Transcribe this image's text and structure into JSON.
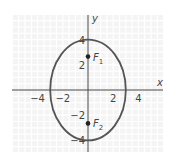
{
  "chart_data": {
    "type": "scatter",
    "title": "",
    "xlabel": "x",
    "ylabel": "y",
    "xlim": [
      -6,
      6
    ],
    "ylim": [
      -5,
      6
    ],
    "grid": true,
    "x_ticks": [
      -4,
      -2,
      2,
      4
    ],
    "y_ticks": [
      4,
      2,
      -2,
      -4
    ],
    "tick_labels": {
      "x": [
        "−4",
        "−2",
        "2",
        "4"
      ],
      "y": [
        "4",
        "2",
        "−2",
        "−4"
      ]
    },
    "ellipse": {
      "center": [
        0,
        0
      ],
      "semi_x": 3,
      "semi_y": 4
    },
    "points": [
      {
        "label": "F",
        "sub": "1",
        "x": 0,
        "y": 2.65
      },
      {
        "label": "F",
        "sub": "2",
        "x": 0,
        "y": -2.65
      }
    ],
    "colors": {
      "curve": "#555555",
      "axis": "#444444",
      "grid": "#e8e8e8",
      "background": "#f4f4f4"
    }
  }
}
